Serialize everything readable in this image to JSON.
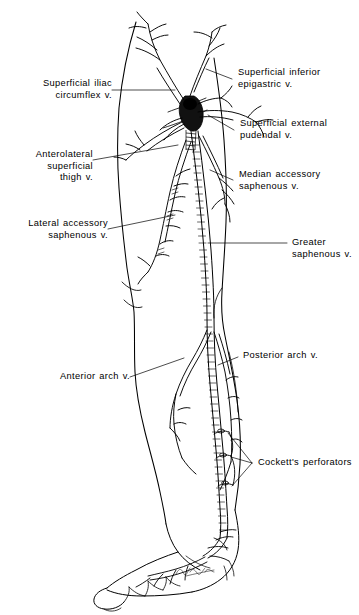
{
  "figure": {
    "background_color": "#ffffff",
    "ink_color": "#000000",
    "width": 359,
    "height": 615
  },
  "labels": {
    "superficial_iliac_circumflex": "Superficial iliac\ncircumflex v.",
    "anterolateral_superficial_thigh": "Anterolateral\nsuperficial\nthigh v.",
    "lateral_accessory_saphenous": "Lateral accessory\nsaphenous v.",
    "anterior_arch": "Anterior arch v.",
    "superficial_inferior_epigastric": "Superficial inferior\nepigastric v.",
    "superficial_external_pudendal": "Superficial external\npudendal v.",
    "median_accessory_saphenous": "Median accessory\nsaphenous v.",
    "greater_saphenous": "Greater saphenous v.",
    "posterior_arch": "Posterior arch v.",
    "cocketts_perforators": "Cockett's perforators"
  },
  "anatomy": {
    "limb": "right lower extremity, anteromedial view",
    "structures": [
      "saphenofemoral junction",
      "greater saphenous vein",
      "anterior arch vein",
      "posterior arch vein",
      "Cockett's perforating veins",
      "dorsal venous arch of foot"
    ]
  }
}
